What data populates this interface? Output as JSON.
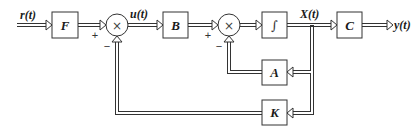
{
  "diagram": {
    "type": "state-feedback control block diagram",
    "signals": {
      "input": "r(t)",
      "control": "u(t)",
      "state": "X(t)",
      "output": "y(t)"
    },
    "blocks": [
      {
        "id": "F",
        "label": "F"
      },
      {
        "id": "B",
        "label": "B"
      },
      {
        "id": "integrator",
        "label": "∫"
      },
      {
        "id": "C",
        "label": "C"
      },
      {
        "id": "A",
        "label": "A"
      },
      {
        "id": "K",
        "label": "K"
      }
    ],
    "summing_junctions": [
      {
        "id": "sum1",
        "symbol": "×",
        "plus": "+",
        "minus": "−"
      },
      {
        "id": "sum2",
        "symbol": "×",
        "plus": "+",
        "minus": "−"
      }
    ],
    "connections": [
      "r(t) → F",
      "F → sum1 (+)",
      "sum1 → B (u(t))",
      "B → sum2 (+)",
      "sum2 → ∫",
      "∫ → C (X(t))",
      "C → y(t)",
      "X(t) → A",
      "A → sum2 (−)",
      "X(t) → K",
      "K → sum1 (−)"
    ],
    "colors": {
      "line": "#333333",
      "background": "#ffffff",
      "text": "#1a1a1a"
    }
  }
}
